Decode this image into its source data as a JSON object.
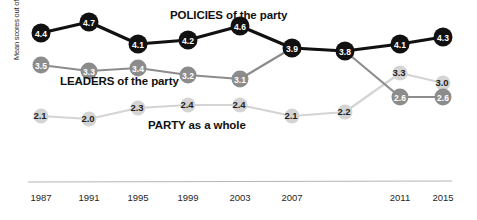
{
  "chart_data": {
    "type": "line",
    "title": "",
    "xlabel": "",
    "ylabel": "Mean scores out of 10",
    "categories": [
      "1987",
      "1991",
      "1995",
      "1999",
      "2003",
      "2007",
      "2009",
      "2011",
      "2015"
    ],
    "tick_labels": [
      "1987",
      "1991",
      "1995",
      "1999",
      "2003",
      "2007",
      "2011",
      "2015"
    ],
    "ylim": [
      1.5,
      5.0
    ],
    "grid": false,
    "legend_position": "inline-annotations",
    "series": [
      {
        "name": "POLICIES of the party",
        "color": "#111111",
        "label_color": "#ffffff",
        "values": [
          4.4,
          4.7,
          4.1,
          4.2,
          4.6,
          3.9,
          3.8,
          4.1,
          4.3
        ],
        "point_labels": [
          "4.4",
          "4.7",
          "4.1",
          "4.2",
          "4.6",
          "3.9",
          "3.8",
          "4.1",
          "4.3"
        ]
      },
      {
        "name": "LEADERS of the party",
        "color": "#8c8c8c",
        "label_color": "#ffffff",
        "values": [
          3.5,
          3.3,
          3.4,
          3.2,
          3.1,
          3.9,
          3.8,
          2.6,
          2.6
        ],
        "point_labels": [
          "3.5",
          "3.3",
          "3.4",
          "3.2",
          "3.1",
          "3.9",
          "3.8",
          "2.6",
          "2.6"
        ]
      },
      {
        "name": "PARTY as a whole",
        "color": "#d4d4d4",
        "label_color": "#2a2a2a",
        "values": [
          2.1,
          2.0,
          2.3,
          2.4,
          2.4,
          2.1,
          2.2,
          3.3,
          3.0
        ],
        "point_labels": [
          "2.1",
          "2.0",
          "2.3",
          "2.4",
          "2.4",
          "2.1",
          "2.2",
          "3.3",
          "3.0"
        ]
      }
    ],
    "annotations": [
      {
        "id": "policies",
        "text": "POLICIES of the party"
      },
      {
        "id": "leaders",
        "text": "LEADERS of the party"
      },
      {
        "id": "party",
        "text": "PARTY as a whole"
      }
    ]
  },
  "axis": {
    "y_title": "Mean scores out of 10",
    "x_ticks": [
      "1987",
      "1991",
      "1995",
      "1999",
      "2003",
      "2007",
      "2011",
      "2015"
    ]
  },
  "labels": {
    "policies": "POLICIES of the party",
    "leaders": "LEADERS of the party",
    "party": "PARTY as a whole"
  },
  "colors": {
    "policies": "#111111",
    "leaders": "#8c8c8c",
    "party": "#d4d4d4",
    "axis_line": "#b5b5b5",
    "background": "#ffffff",
    "tick_text": "#1f1f1f"
  },
  "points": {
    "policies": [
      {
        "label": "4.4",
        "x": 41,
        "y": 33
      },
      {
        "label": "4.7",
        "x": 89,
        "y": 22
      },
      {
        "label": "4.1",
        "x": 138,
        "y": 44
      },
      {
        "label": "4.2",
        "x": 188,
        "y": 40
      },
      {
        "label": "4.6",
        "x": 240,
        "y": 26
      },
      {
        "label": "3.9",
        "x": 292,
        "y": 48
      },
      {
        "label": "3.8",
        "x": 345,
        "y": 51
      },
      {
        "label": "4.1",
        "x": 400,
        "y": 44
      },
      {
        "label": "4.3",
        "x": 443,
        "y": 37
      }
    ],
    "leaders": [
      {
        "label": "3.5",
        "x": 41,
        "y": 65
      },
      {
        "label": "3.3",
        "x": 89,
        "y": 71
      },
      {
        "label": "3.4",
        "x": 138,
        "y": 68
      },
      {
        "label": "3.2",
        "x": 188,
        "y": 75
      },
      {
        "label": "3.1",
        "x": 240,
        "y": 79
      },
      {
        "label": "3.9",
        "x": 292,
        "y": 48
      },
      {
        "label": "3.8",
        "x": 345,
        "y": 51
      },
      {
        "label": "2.6",
        "x": 400,
        "y": 97
      },
      {
        "label": "2.6",
        "x": 443,
        "y": 97
      }
    ],
    "party": [
      {
        "label": "2.1",
        "x": 41,
        "y": 116
      },
      {
        "label": "2.0",
        "x": 89,
        "y": 119
      },
      {
        "label": "2.3",
        "x": 138,
        "y": 108
      },
      {
        "label": "2.4",
        "x": 188,
        "y": 105
      },
      {
        "label": "2.4",
        "x": 240,
        "y": 105
      },
      {
        "label": "2.1",
        "x": 292,
        "y": 116
      },
      {
        "label": "2.2",
        "x": 345,
        "y": 112
      },
      {
        "label": "3.3",
        "x": 400,
        "y": 73
      },
      {
        "label": "3.0",
        "x": 443,
        "y": 83
      }
    ]
  },
  "tick_positions": [
    41,
    89,
    138,
    188,
    240,
    292,
    400,
    443
  ]
}
